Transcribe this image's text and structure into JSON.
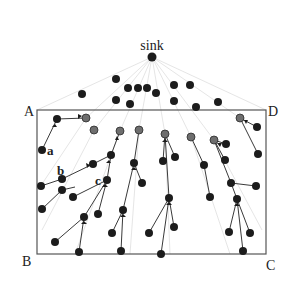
{
  "labels": {
    "sink": "sink",
    "corner_a": "A",
    "corner_b": "B",
    "corner_c": "C",
    "corner_d": "D",
    "node_a": "a",
    "node_b": "b",
    "node_c": "c"
  },
  "colors": {
    "node": "#1c1c1c",
    "relay_node": "#6e6e6e",
    "edge": "#3a3a3a",
    "ray": "#d4d4d4",
    "border": "#555555"
  },
  "sink": {
    "x": 152,
    "y": 57
  },
  "rectangle": {
    "x1": 37,
    "y1": 110,
    "x2": 266,
    "y2": 254
  },
  "outer_nodes": [
    [
      116,
      79
    ],
    [
      128,
      88
    ],
    [
      138,
      88
    ],
    [
      147,
      88
    ],
    [
      156,
      93
    ],
    [
      174,
      85
    ],
    [
      190,
      85
    ],
    [
      82,
      94
    ],
    [
      116,
      100
    ],
    [
      130,
      103
    ],
    [
      174,
      101
    ],
    [
      196,
      107
    ],
    [
      218,
      102
    ]
  ],
  "relay_nodes": [
    [
      86,
      118
    ],
    [
      94,
      130
    ],
    [
      120,
      131
    ],
    [
      139,
      130
    ],
    [
      165,
      134
    ],
    [
      191,
      137
    ],
    [
      214,
      140
    ],
    [
      240,
      118
    ]
  ],
  "leaf_nodes": [
    [
      57,
      119
    ],
    [
      42,
      150
    ],
    [
      62,
      179
    ],
    [
      41,
      186
    ],
    [
      75,
      187
    ],
    [
      93,
      164
    ],
    [
      111,
      155
    ],
    [
      107,
      180
    ],
    [
      99,
      200
    ],
    [
      73,
      197
    ],
    [
      42,
      209
    ],
    [
      84,
      217
    ],
    [
      55,
      242
    ],
    [
      79,
      252
    ],
    [
      115,
      202
    ],
    [
      98,
      214
    ],
    [
      134,
      163
    ],
    [
      142,
      183
    ],
    [
      123,
      210
    ],
    [
      112,
      233
    ],
    [
      121,
      251
    ],
    [
      163,
      161
    ],
    [
      175,
      157
    ],
    [
      169,
      198
    ],
    [
      149,
      233
    ],
    [
      161,
      254
    ],
    [
      174,
      227
    ],
    [
      226,
      144
    ],
    [
      225,
      160
    ],
    [
      231,
      183
    ],
    [
      237,
      199
    ],
    [
      229,
      232
    ],
    [
      250,
      233
    ],
    [
      243,
      251
    ],
    [
      257,
      127
    ],
    [
      258,
      154
    ],
    [
      256,
      186
    ]
  ]
}
